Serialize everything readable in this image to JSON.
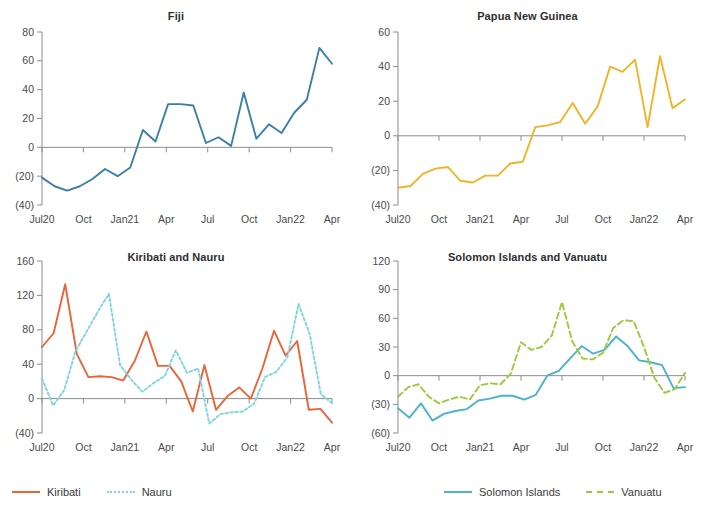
{
  "page": {
    "background": "#ffffff",
    "cropped_header_text": ""
  },
  "colors": {
    "fiji_line": "#3a7fa8",
    "png_line": "#f0b429",
    "kiribati_line": "#e8653a",
    "nauru_line": "#7fd4e0",
    "solomon_line": "#4bb3c9",
    "vanuatu_line": "#9ec93c",
    "axis": "#8c8c8c",
    "zero_line": "#8c8c8c",
    "text": "#3d3d3d",
    "title": "#2e2e2e"
  },
  "shared": {
    "x_tick_labels": [
      "Jul20",
      "Oct",
      "Jan21",
      "Apr",
      "Jul",
      "Oct",
      "Jan22",
      "Apr"
    ],
    "x_tick_months": [
      0,
      3,
      6,
      9,
      12,
      15,
      18,
      21
    ],
    "n_points": 22
  },
  "legends": [
    {
      "panel": "Kiribati and Nauru",
      "items": [
        {
          "label": "Kiribati",
          "color": "#e8653a",
          "style": "solid"
        },
        {
          "label": "Nauru",
          "color": "#7fd4e0",
          "style": "dotted"
        }
      ]
    },
    {
      "panel": "Solomon Islands and Vanuatu",
      "items": [
        {
          "label": "Solomon Islands",
          "color": "#4bb3c9",
          "style": "solid"
        },
        {
          "label": "Vanuatu",
          "color": "#9ec93c",
          "style": "dashed"
        }
      ]
    }
  ],
  "chart_data": [
    {
      "id": "fiji",
      "type": "line",
      "title": "Fiji",
      "xlabel": "",
      "ylabel": "",
      "grid": false,
      "legend_position": "none",
      "x": [
        "Jul20",
        "Aug20",
        "Sep20",
        "Oct20",
        "Nov20",
        "Dec20",
        "Jan21",
        "Feb21",
        "Mar21",
        "Apr21",
        "May21",
        "Jun21",
        "Jul21",
        "Aug21",
        "Sep21",
        "Oct21",
        "Nov21",
        "Dec21",
        "Jan22",
        "Feb22",
        "Mar22",
        "Apr22"
      ],
      "ytick_labels": [
        "(40)",
        "(20)",
        "0",
        "20",
        "40",
        "60",
        "80"
      ],
      "yticks": [
        -40,
        -20,
        0,
        20,
        40,
        60,
        80
      ],
      "ylim": [
        -40,
        80
      ],
      "series": [
        {
          "name": "Fiji",
          "color": "#3a7fa8",
          "style": "solid",
          "values": [
            -21,
            -27,
            -30,
            -27,
            -22,
            -15,
            -20,
            -14,
            12,
            4,
            30,
            30,
            29,
            3,
            7,
            1,
            38,
            6,
            16,
            10,
            24,
            33,
            69,
            58
          ]
        }
      ]
    },
    {
      "id": "papua-new-guinea",
      "type": "line",
      "title": "Papua New Guinea",
      "xlabel": "",
      "ylabel": "",
      "grid": false,
      "legend_position": "none",
      "x": [
        "Jul20",
        "Aug20",
        "Sep20",
        "Oct20",
        "Nov20",
        "Dec20",
        "Jan21",
        "Feb21",
        "Mar21",
        "Apr21",
        "May21",
        "Jun21",
        "Jul21",
        "Aug21",
        "Sep21",
        "Oct21",
        "Nov21",
        "Dec21",
        "Jan22",
        "Feb22",
        "Mar22",
        "Apr22"
      ],
      "ytick_labels": [
        "(40)",
        "(20)",
        "0",
        "20",
        "40",
        "60"
      ],
      "yticks": [
        -40,
        -20,
        0,
        20,
        40,
        60
      ],
      "ylim": [
        -40,
        60
      ],
      "series": [
        {
          "name": "Papua New Guinea",
          "color": "#f0b429",
          "style": "solid",
          "values": [
            -30,
            -29,
            -22,
            -19,
            -18,
            -26,
            -27,
            -23,
            -23,
            -16,
            -15,
            5,
            6,
            8,
            19,
            7,
            17,
            40,
            37,
            44,
            5,
            46,
            16,
            21
          ]
        }
      ]
    },
    {
      "id": "kiribati-and-nauru",
      "type": "line",
      "title": "Kiribati and Nauru",
      "xlabel": "",
      "ylabel": "",
      "grid": false,
      "legend_position": "bottom-left",
      "x": [
        "Jul20",
        "Aug20",
        "Sep20",
        "Oct20",
        "Nov20",
        "Dec20",
        "Jan21",
        "Feb21",
        "Mar21",
        "Apr21",
        "May21",
        "Jun21",
        "Jul21",
        "Aug21",
        "Sep21",
        "Oct21",
        "Nov21",
        "Dec21",
        "Jan22",
        "Feb22",
        "Mar22",
        "Apr22"
      ],
      "ytick_labels": [
        "(40)",
        "0",
        "40",
        "80",
        "120",
        "160"
      ],
      "yticks": [
        -40,
        0,
        40,
        80,
        120,
        160
      ],
      "ylim": [
        -40,
        160
      ],
      "series": [
        {
          "name": "Kiribati",
          "color": "#e8653a",
          "style": "solid",
          "values": [
            60,
            76,
            133,
            52,
            25,
            26,
            25,
            21,
            44,
            78,
            38,
            38,
            20,
            -15,
            39,
            -13,
            3,
            13,
            0,
            35,
            79,
            50,
            67,
            -13,
            -12,
            -28
          ]
        },
        {
          "name": "Nauru",
          "color": "#7fd4e0",
          "style": "dotted",
          "values": [
            23,
            -8,
            10,
            55,
            78,
            101,
            122,
            39,
            22,
            8,
            18,
            26,
            56,
            30,
            35,
            -29,
            -18,
            -16,
            -15,
            -6,
            25,
            31,
            48,
            110,
            75,
            5,
            -5
          ]
        }
      ]
    },
    {
      "id": "solomon-islands-and-vanuatu",
      "type": "line",
      "title": "Solomon Islands and Vanuatu",
      "xlabel": "",
      "ylabel": "",
      "grid": false,
      "legend_position": "bottom-right",
      "x": [
        "Jul20",
        "Aug20",
        "Sep20",
        "Oct20",
        "Nov20",
        "Dec20",
        "Jan21",
        "Feb21",
        "Mar21",
        "Apr21",
        "May21",
        "Jun21",
        "Jul21",
        "Aug21",
        "Sep21",
        "Oct21",
        "Nov21",
        "Dec21",
        "Jan22",
        "Feb22",
        "Mar22",
        "Apr22"
      ],
      "ytick_labels": [
        "(60)",
        "(30)",
        "0",
        "30",
        "60",
        "90",
        "120"
      ],
      "yticks": [
        -60,
        -30,
        0,
        30,
        60,
        90,
        120
      ],
      "ylim": [
        -60,
        120
      ],
      "series": [
        {
          "name": "Solomon Islands",
          "color": "#4bb3c9",
          "style": "solid",
          "values": [
            -34,
            -44,
            -29,
            -47,
            -40,
            -37,
            -35,
            -26,
            -24,
            -21,
            -21,
            -25,
            -20,
            0,
            5,
            18,
            31,
            23,
            27,
            41,
            31,
            16,
            14,
            11,
            -13,
            -12
          ]
        },
        {
          "name": "Vanuatu",
          "color": "#9ec93c",
          "style": "dashed",
          "values": [
            -22,
            -12,
            -9,
            -22,
            -29,
            -25,
            -22,
            -25,
            -10,
            -8,
            -9,
            2,
            35,
            27,
            30,
            42,
            77,
            36,
            18,
            17,
            24,
            50,
            58,
            57,
            30,
            -2,
            -18,
            -14,
            3
          ]
        }
      ]
    }
  ]
}
